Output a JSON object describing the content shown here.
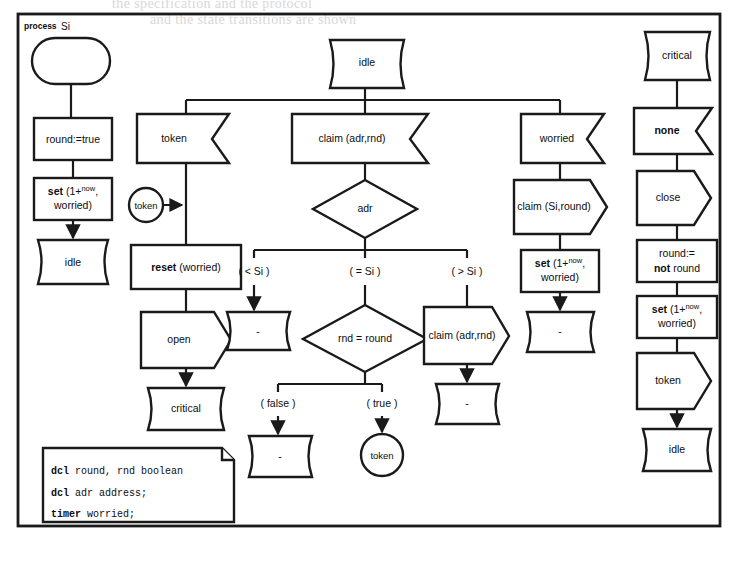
{
  "page": {
    "background_faint_lines": [
      "the specification and the protocol",
      "and the state transitions are shown"
    ]
  },
  "diagram": {
    "type": "sdl-process-diagram",
    "frame_label_keyword": "process",
    "frame_label_name": "Si",
    "colors": {
      "ink": "#1a1a1a",
      "paper": "#ffffff"
    }
  },
  "columns": {
    "start": {
      "name": "start-column",
      "nodes": [
        {
          "id": "start",
          "kind": "start",
          "label": ""
        },
        {
          "id": "task_round_true",
          "kind": "task",
          "label": "round:=true"
        },
        {
          "id": "task_set_1",
          "kind": "task",
          "label": "set (1+now, worried)",
          "parts": {
            "keyword": "set",
            "text1": " (1",
            "plus": "+",
            "sup": "now",
            "text2": ", worried)"
          }
        },
        {
          "id": "state_idle_1",
          "kind": "state",
          "label": "idle"
        }
      ]
    },
    "token_branch": {
      "name": "token-input-branch",
      "nodes": [
        {
          "id": "input_token",
          "kind": "input",
          "label": "token"
        },
        {
          "id": "save_token",
          "kind": "save",
          "label": "token"
        },
        {
          "id": "task_reset",
          "kind": "task",
          "label": "reset (worried)",
          "parts": {
            "keyword": "reset",
            "text1": " (worried)"
          }
        },
        {
          "id": "output_open",
          "kind": "output",
          "label": "open"
        },
        {
          "id": "state_critical_1",
          "kind": "state",
          "label": "critical"
        }
      ]
    },
    "claim_branch": {
      "name": "claim-input-branch",
      "nodes": [
        {
          "id": "state_idle_top",
          "kind": "state",
          "label": "idle"
        },
        {
          "id": "input_claim",
          "kind": "input",
          "label": "claim (adr,rnd)"
        },
        {
          "id": "decision_adr",
          "kind": "decision",
          "label": "adr"
        },
        {
          "id": "branch_lt",
          "kind": "branch",
          "label": "( < Si )"
        },
        {
          "id": "branch_eq",
          "kind": "branch",
          "label": "( = Si )"
        },
        {
          "id": "branch_gt",
          "kind": "branch",
          "label": "( > Si )"
        },
        {
          "id": "state_dash_lt",
          "kind": "state",
          "label": "-"
        },
        {
          "id": "decision_rnd",
          "kind": "decision",
          "label": "rnd = round"
        },
        {
          "id": "branch_false",
          "kind": "branch",
          "label": "( false )"
        },
        {
          "id": "branch_true",
          "kind": "branch",
          "label": "( true )"
        },
        {
          "id": "state_dash_false",
          "kind": "state",
          "label": "-"
        },
        {
          "id": "save_token_true",
          "kind": "save",
          "label": "token"
        },
        {
          "id": "output_claim_gt",
          "kind": "output",
          "label": "claim (adr,rnd)"
        },
        {
          "id": "state_dash_gt",
          "kind": "state",
          "label": "-"
        }
      ]
    },
    "worried_branch": {
      "name": "worried-input-branch",
      "nodes": [
        {
          "id": "input_worried",
          "kind": "input",
          "label": "worried"
        },
        {
          "id": "output_claim_si",
          "kind": "output",
          "label": "claim (Si,round)"
        },
        {
          "id": "task_set_2",
          "kind": "task",
          "label": "set (1+now, worried)",
          "parts": {
            "keyword": "set",
            "text1": " (1",
            "plus": "+",
            "sup": "now",
            "text2": ", worried)"
          }
        },
        {
          "id": "state_dash_worried",
          "kind": "state",
          "label": "-"
        }
      ]
    },
    "critical": {
      "name": "critical-column",
      "nodes": [
        {
          "id": "state_critical_top",
          "kind": "state",
          "label": "critical"
        },
        {
          "id": "input_none",
          "kind": "input",
          "label": "none"
        },
        {
          "id": "output_close",
          "kind": "output",
          "label": "close"
        },
        {
          "id": "task_round_not",
          "kind": "task",
          "label": "round:= not round",
          "parts": {
            "line1": "round:=",
            "keyword": "not",
            "line2": " round"
          }
        },
        {
          "id": "task_set_3",
          "kind": "task",
          "label": "set (1+now, worried)",
          "parts": {
            "keyword": "set",
            "text1": " (1",
            "plus": "+",
            "sup": "now",
            "text2": ", worried)"
          }
        },
        {
          "id": "output_token",
          "kind": "output",
          "label": "token"
        },
        {
          "id": "state_idle_end",
          "kind": "state",
          "label": "idle"
        }
      ]
    }
  },
  "declaration_box": {
    "name": "declaration-text-box",
    "lines": [
      {
        "keyword": "dcl",
        "text": " round, rnd boolean"
      },
      {
        "keyword": "dcl",
        "text": " adr address;"
      },
      {
        "keyword": "timer",
        "text": " worried;"
      }
    ]
  }
}
